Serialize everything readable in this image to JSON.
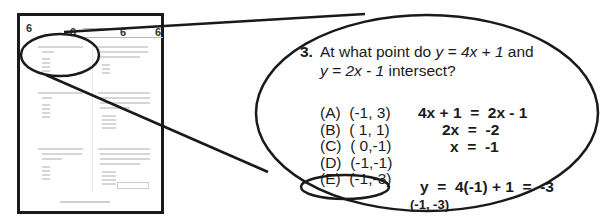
{
  "thumbnail": {
    "header_numbers": [
      "6",
      "6",
      "6",
      "6"
    ],
    "content_legible": false
  },
  "zoomed_question": {
    "number": "3.",
    "line1_prefix": "At what point do ",
    "eq1": "y = 4x + 1",
    "line1_suffix": " and",
    "eq2": "y = 2x - 1",
    "line2_suffix": " intersect?",
    "choices": [
      {
        "letter": "(A)",
        "value": "(-1, 3)"
      },
      {
        "letter": "(B)",
        "value": "( 1, 1)"
      },
      {
        "letter": "(C)",
        "value": "( 0,-1)"
      },
      {
        "letter": "(D)",
        "value": "(-1,-1)"
      },
      {
        "letter": "(E)",
        "value": "(-1,-3)"
      }
    ],
    "selected_choice": "(E)",
    "work": {
      "step1": "4x + 1  =  2x - 1",
      "step2": "2x  =  -2",
      "step3": "x  =  -1",
      "step4": "y  =  4(-1) + 1  =  -3"
    },
    "final_answer": "(-1, -3)"
  }
}
